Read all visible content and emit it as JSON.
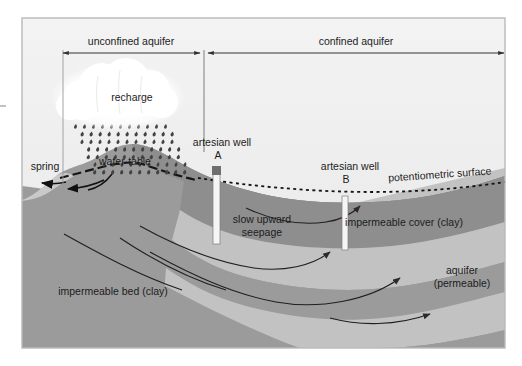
{
  "figure": {
    "frame": {
      "stroke": "#b9b9b9",
      "x": 22,
      "y": 18,
      "w": 483,
      "h": 330
    }
  },
  "palette": {
    "sky": "#ececec",
    "sky_top": "#f2f2f2",
    "impermeable_bed": "#9b9b9b",
    "impermeable_cover": "#8e8e8e",
    "aquifer": "#c2c2c2",
    "saturated_zone": "#8e8e8e",
    "cloud": "#ffffff",
    "rain": "#4a4a4a",
    "well_tube": "#f4f4f4",
    "well_collar": "#6e6e6e",
    "ink": "#1c1c1c",
    "dimension_line": "#3a3a3a"
  },
  "dimensions": {
    "unconfined": {
      "label": "unconfined aquifer",
      "x1": 63,
      "x2": 203,
      "y": 50
    },
    "confined": {
      "label": "confined aquifer",
      "x1": 205,
      "x2": 505,
      "y": 50
    }
  },
  "labels": {
    "recharge": "recharge",
    "spring": "spring",
    "water_table": "water-table",
    "artesian_well_a_title": "artesian well",
    "artesian_well_a_id": "A",
    "artesian_well_b_title": "artesian well",
    "artesian_well_b_id": "B",
    "potentiometric_surface": "potentiometric surface",
    "slow_upward_line1": "slow upward",
    "slow_upward_line2": "seepage",
    "impermeable_cover": "impermeable cover (clay)",
    "impermeable_bed": "impermeable bed (clay)",
    "aquifer_line1": "aquifer",
    "aquifer_line2": "(permeable)"
  },
  "features": {
    "wells": [
      {
        "id": "A",
        "x": 216,
        "top": 170,
        "bottom": 243,
        "width": 6,
        "collar_height": 8
      },
      {
        "id": "B",
        "x": 344,
        "top": 196,
        "bottom": 247,
        "width": 5,
        "collar_height": 0
      }
    ],
    "flow_arrows": 5,
    "rain_columns": 11,
    "rain_rows": 7
  }
}
